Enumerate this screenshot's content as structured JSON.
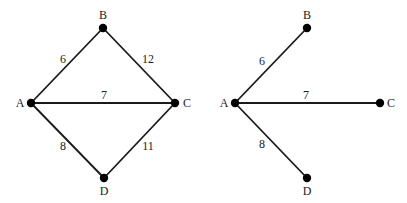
{
  "graphs": [
    {
      "id": "original-graph",
      "nodes": [
        {
          "id": "A",
          "label": "A",
          "x": 31,
          "y": 103,
          "lx": 20,
          "ly": 104
        },
        {
          "id": "B",
          "label": "B",
          "x": 103,
          "y": 28,
          "lx": 103,
          "ly": 16
        },
        {
          "id": "C",
          "label": "C",
          "x": 175,
          "y": 103,
          "lx": 187,
          "ly": 104
        },
        {
          "id": "D",
          "label": "D",
          "x": 104,
          "y": 178,
          "lx": 104,
          "ly": 192
        }
      ],
      "edges": [
        {
          "from": "A",
          "to": "B",
          "weight": "6",
          "wx": 63,
          "wy": 60
        },
        {
          "from": "B",
          "to": "C",
          "weight": "12",
          "wx": 148,
          "wy": 60
        },
        {
          "from": "A",
          "to": "C",
          "weight": "7",
          "wx": 104,
          "wy": 96
        },
        {
          "from": "A",
          "to": "D",
          "weight": "8",
          "wx": 63,
          "wy": 147
        },
        {
          "from": "C",
          "to": "D",
          "weight": "11",
          "wx": 148,
          "wy": 147
        }
      ]
    },
    {
      "id": "shortest-path-tree",
      "nodes": [
        {
          "id": "A",
          "label": "A",
          "x": 235,
          "y": 103,
          "lx": 224,
          "ly": 104
        },
        {
          "id": "B",
          "label": "B",
          "x": 307,
          "y": 28,
          "lx": 307,
          "ly": 16
        },
        {
          "id": "C",
          "label": "C",
          "x": 380,
          "y": 103,
          "lx": 391,
          "ly": 104
        },
        {
          "id": "D",
          "label": "D",
          "x": 307,
          "y": 178,
          "lx": 307,
          "ly": 192
        }
      ],
      "edges": [
        {
          "from": "A",
          "to": "B",
          "weight": "6",
          "wx": 262,
          "wy": 62
        },
        {
          "from": "A",
          "to": "C",
          "weight": "7",
          "wx": 306,
          "wy": 96
        },
        {
          "from": "A",
          "to": "D",
          "weight": "8",
          "wx": 262,
          "wy": 145
        }
      ]
    }
  ],
  "style": {
    "edge_color": "#1a1a1a",
    "node_color": "#000000",
    "text_color": "#222222",
    "background": "#ffffff"
  }
}
